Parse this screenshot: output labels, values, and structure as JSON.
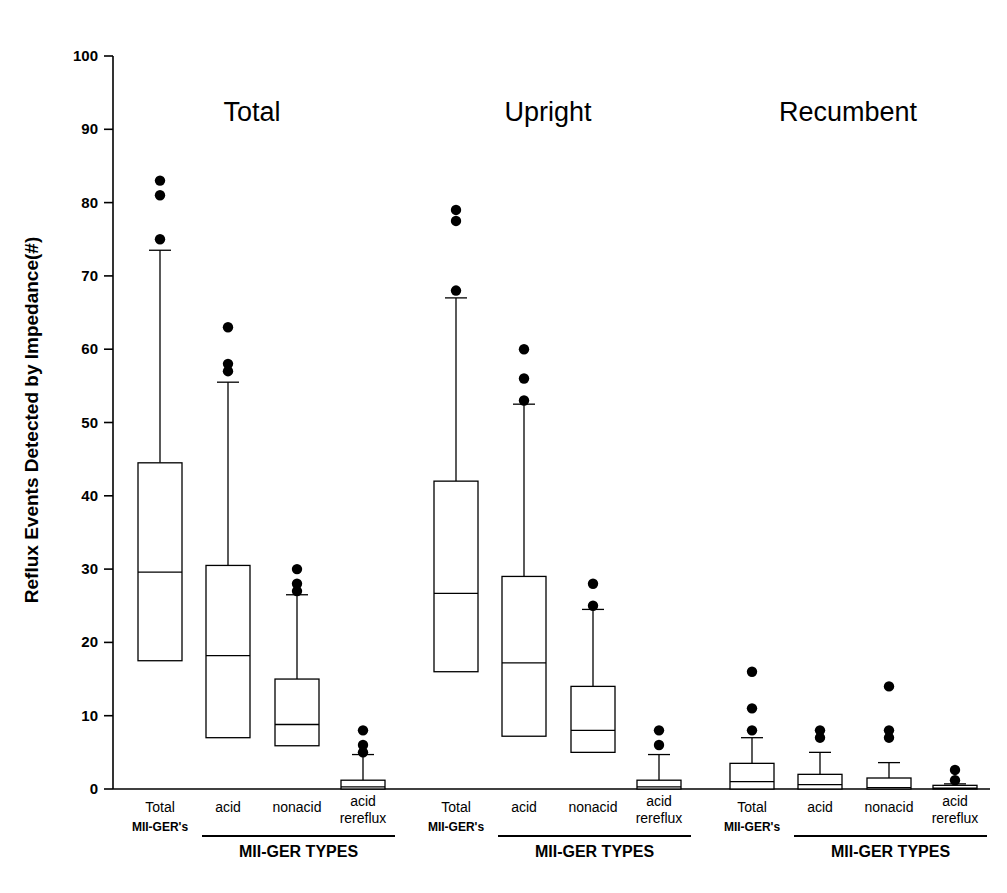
{
  "chart_data": {
    "type": "box",
    "title": "",
    "xlabel": "MII-GER TYPES",
    "ylabel": "Reflux Events Detected by Impedance(#)",
    "ylim": [
      0,
      100
    ],
    "yticks": [
      0,
      10,
      20,
      30,
      40,
      50,
      60,
      70,
      80,
      90,
      100
    ],
    "ytick_labels": [
      "0",
      "10",
      "20",
      "30",
      "40",
      "50",
      "60",
      "70",
      "80",
      "90",
      "100"
    ],
    "grid": false,
    "legend": "none",
    "categories": [
      "Total MII-GER's",
      "acid",
      "nonacid",
      "acid rereflux"
    ],
    "panels": [
      {
        "name": "Total",
        "boxes": [
          {
            "category": "Total MII-GER's",
            "q1": 17.5,
            "median": 29.6,
            "q3": 44.5,
            "whisker_low": 17.5,
            "whisker_high": 73.5,
            "outliers": [
              83,
              81,
              75
            ]
          },
          {
            "category": "acid",
            "q1": 7.0,
            "median": 18.2,
            "q3": 30.5,
            "whisker_low": 7.0,
            "whisker_high": 55.5,
            "outliers": [
              63,
              58,
              57
            ]
          },
          {
            "category": "nonacid",
            "q1": 5.9,
            "median": 8.8,
            "q3": 15.0,
            "whisker_low": 5.9,
            "whisker_high": 26.5,
            "outliers": [
              30,
              28,
              27
            ]
          },
          {
            "category": "acid rereflux",
            "q1": 0.0,
            "median": 0.3,
            "q3": 1.2,
            "whisker_low": 0.0,
            "whisker_high": 4.7,
            "outliers": [
              8,
              6,
              5
            ]
          }
        ]
      },
      {
        "name": "Upright",
        "boxes": [
          {
            "category": "Total MII-GER's",
            "q1": 16.0,
            "median": 26.7,
            "q3": 42.0,
            "whisker_low": 16.0,
            "whisker_high": 67.0,
            "outliers": [
              79,
              77.5,
              68
            ]
          },
          {
            "category": "acid",
            "q1": 7.2,
            "median": 17.2,
            "q3": 29.0,
            "whisker_low": 7.2,
            "whisker_high": 52.5,
            "outliers": [
              60,
              56,
              53
            ]
          },
          {
            "category": "nonacid",
            "q1": 5.0,
            "median": 8.0,
            "q3": 14.0,
            "whisker_low": 5.0,
            "whisker_high": 24.5,
            "outliers": [
              28,
              25
            ]
          },
          {
            "category": "acid rereflux",
            "q1": 0.0,
            "median": 0.3,
            "q3": 1.2,
            "whisker_low": 0.0,
            "whisker_high": 4.7,
            "outliers": [
              8,
              6
            ]
          }
        ]
      },
      {
        "name": "Recumbent",
        "boxes": [
          {
            "category": "Total MII-GER's",
            "q1": 0.0,
            "median": 1.0,
            "q3": 3.5,
            "whisker_low": 0.0,
            "whisker_high": 7.0,
            "outliers": [
              16,
              11,
              8
            ]
          },
          {
            "category": "acid",
            "q1": 0.0,
            "median": 0.6,
            "q3": 2.0,
            "whisker_low": 0.0,
            "whisker_high": 5.0,
            "outliers": [
              8,
              7
            ]
          },
          {
            "category": "nonacid",
            "q1": 0.0,
            "median": 0.2,
            "q3": 1.5,
            "whisker_low": 0.0,
            "whisker_high": 3.6,
            "outliers": [
              14,
              8,
              7
            ]
          },
          {
            "category": "acid rereflux",
            "q1": 0.0,
            "median": 0.1,
            "q3": 0.5,
            "whisker_low": 0.0,
            "whisker_high": 0.7,
            "outliers": [
              2.6,
              1.2
            ]
          }
        ]
      }
    ]
  },
  "axes": {
    "y_label": "Reflux Events Detected by Impedance(#)",
    "tick_labels": [
      "100",
      "90",
      "80",
      "70",
      "60",
      "50",
      "40",
      "30",
      "20",
      "10",
      "0"
    ]
  },
  "panel_titles": {
    "p0": "Total",
    "p1": "Upright",
    "p2": "Recumbent"
  },
  "category_labels": {
    "total_line1": "Total",
    "total_line2": "MII-GER's",
    "acid": "acid",
    "nonacid": "nonacid",
    "rereflux_line1": "acid",
    "rereflux_line2": "rereflux",
    "group_axis": "MII-GER TYPES"
  },
  "colors": {
    "stroke": "#000000",
    "fill": "#ffffff",
    "background": "#ffffff"
  }
}
